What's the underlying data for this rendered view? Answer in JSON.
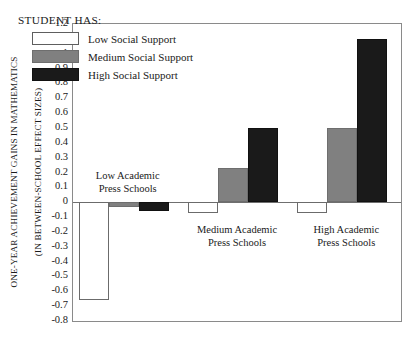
{
  "chart_data": {
    "type": "bar",
    "title": "",
    "subtitle": "",
    "xlabel": "",
    "ylabel": "ONE-YEAR ACHIEVEMENT GAINS IN MATHEMATICS (IN BETWEEN-SCHOOL EFFECT SIZES)",
    "ylabel_line1": "ONE-YEAR ACHIEVEMENT GAINS IN MATHEMATICS",
    "ylabel_line2": "(IN BETWEEN-SCHOOL EFFECT SIZES)",
    "ylim": [
      -0.8,
      1.2
    ],
    "ytick_step": 0.1,
    "yticks": [
      "1.2",
      "1.1",
      "1",
      "0.9",
      "0.8",
      "0.7",
      "0.6",
      "0.5",
      "0.4",
      "0.3",
      "0.2",
      "0.1",
      "0",
      "-0.1",
      "-0.2",
      "-0.3",
      "-0.4",
      "-0.5",
      "-0.6",
      "-0.7",
      "-0.8"
    ],
    "ytick_values": [
      1.2,
      1.1,
      1.0,
      0.9,
      0.8,
      0.7,
      0.6,
      0.5,
      0.4,
      0.3,
      0.2,
      0.1,
      0,
      -0.1,
      -0.2,
      -0.3,
      -0.4,
      -0.5,
      -0.6,
      -0.7,
      -0.8
    ],
    "grid": false,
    "legend_position": "top-left",
    "categories": [
      "Low Academic Press Schools",
      "Medium Academic Press Schools",
      "High Academic Press Schools"
    ],
    "category_labels": [
      {
        "line1": "Low Academic",
        "line2": "Press Schools"
      },
      {
        "line1": "Medium Academic",
        "line2": "Press Schools"
      },
      {
        "line1": "High Academic",
        "line2": "Press Schools"
      }
    ],
    "series": [
      {
        "name": "Low Social Support",
        "key": "low",
        "color": "#ffffff",
        "values": [
          -0.66,
          -0.07,
          -0.07
        ]
      },
      {
        "name": "Medium Social Support",
        "key": "medium",
        "color": "#808080",
        "values": [
          -0.03,
          0.23,
          0.5
        ]
      },
      {
        "name": "High Social Support",
        "key": "high",
        "color": "#1a1a1a",
        "values": [
          -0.06,
          0.5,
          1.1
        ]
      }
    ]
  },
  "legend": {
    "title": "STUDENT HAS:",
    "items": [
      {
        "label": "Low Social Support",
        "key": "low"
      },
      {
        "label": "Medium Social Support",
        "key": "medium"
      },
      {
        "label": "High Social Support",
        "key": "high"
      }
    ]
  }
}
